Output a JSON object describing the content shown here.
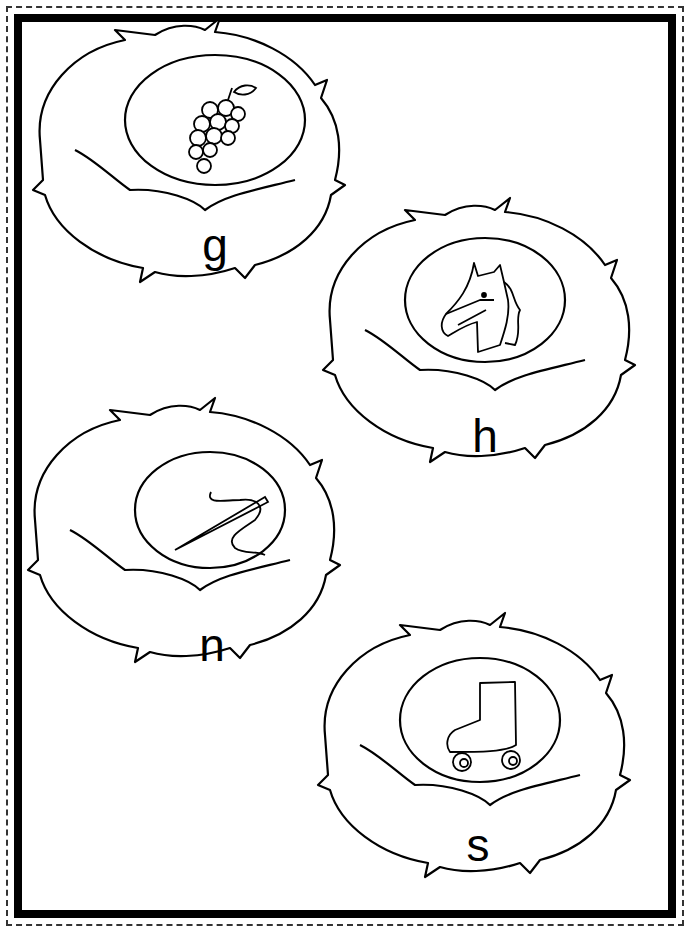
{
  "worksheet": {
    "nests": [
      {
        "letter": "g",
        "picture": "grapes"
      },
      {
        "letter": "h",
        "picture": "horse"
      },
      {
        "letter": "n",
        "picture": "needle"
      },
      {
        "letter": "s",
        "picture": "roller-skate"
      }
    ]
  }
}
